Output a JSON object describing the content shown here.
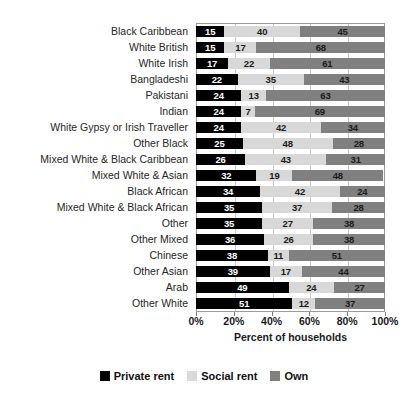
{
  "chart_data": {
    "type": "bar",
    "subtype": "stacked-horizontal-100pct",
    "title": "",
    "xlabel": "Percent of households",
    "ylabel": "",
    "xlim": [
      0,
      100
    ],
    "xticks": [
      0,
      20,
      40,
      60,
      80,
      100
    ],
    "xtick_labels": [
      "0%",
      "20%",
      "40%",
      "60%",
      "80%",
      "100%"
    ],
    "grid": true,
    "legend_position": "bottom",
    "categories": [
      "Black Caribbean",
      "White British",
      "White Irish",
      "Bangladeshi",
      "Pakistani",
      "Indian",
      "White Gypsy or Irish Traveller",
      "Other Black",
      "Mixed White & Black Caribbean",
      "Mixed White & Asian",
      "Black African",
      "Mixed White & Black African",
      "Other",
      "Other Mixed",
      "Chinese",
      "Other Asian",
      "Arab",
      "Other White"
    ],
    "series": [
      {
        "name": "Private rent",
        "color": "#000000",
        "values": [
          15,
          15,
          17,
          22,
          24,
          24,
          24,
          25,
          26,
          32,
          34,
          35,
          35,
          36,
          38,
          39,
          49,
          51
        ]
      },
      {
        "name": "Social rent",
        "color": "#d8d8d8",
        "values": [
          40,
          17,
          22,
          35,
          13,
          7,
          42,
          48,
          43,
          19,
          42,
          37,
          27,
          26,
          11,
          17,
          24,
          12
        ]
      },
      {
        "name": "Own",
        "color": "#808080",
        "values": [
          45,
          68,
          61,
          43,
          63,
          69,
          34,
          28,
          31,
          48,
          24,
          28,
          38,
          38,
          51,
          44,
          27,
          37
        ]
      }
    ]
  },
  "legend": {
    "items": [
      {
        "label": "Private rent",
        "color": "#000000"
      },
      {
        "label": "Social rent",
        "color": "#d8d8d8"
      },
      {
        "label": "Own",
        "color": "#808080"
      }
    ]
  }
}
